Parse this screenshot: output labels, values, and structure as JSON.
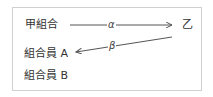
{
  "diagram": {
    "nodes": {
      "kou": "甲組合",
      "otsu": "乙",
      "member_a": "組合員 A",
      "member_b": "組合員 B"
    },
    "edges": [
      {
        "from": "甲組合",
        "to": "乙",
        "label": "α"
      },
      {
        "from": "乙",
        "to": "組合員 A",
        "label": "β"
      }
    ],
    "colors": {
      "border": "#d0d0d0",
      "line": "#555555",
      "text": "#333333"
    }
  }
}
